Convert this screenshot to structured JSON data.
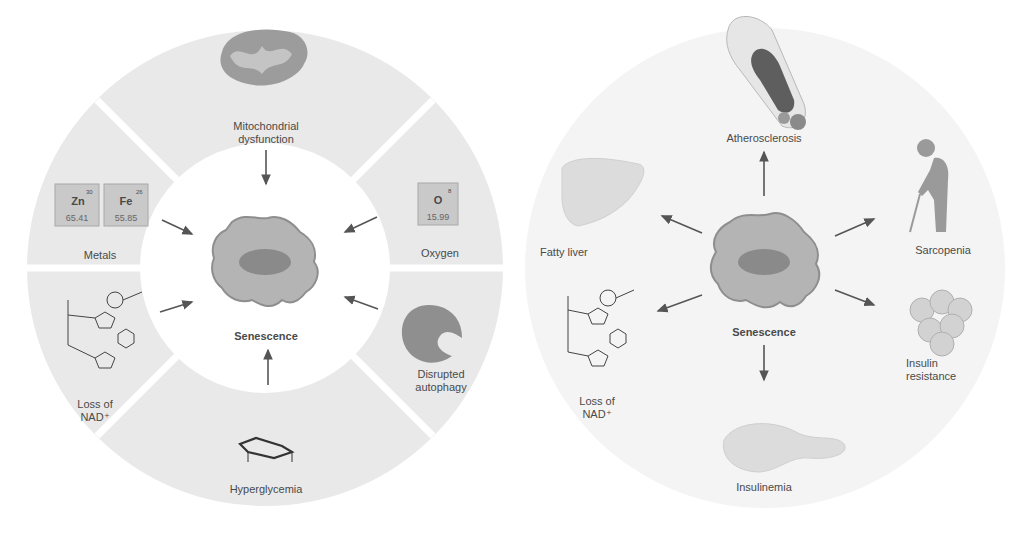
{
  "left_panel": {
    "center_label": "Senescence",
    "segments": [
      {
        "id": "mito",
        "label_line1": "Mitochondrial",
        "label_line2": "dysfunction",
        "icon": "mitochondrion-icon"
      },
      {
        "id": "oxygen",
        "label_line1": "Oxygen",
        "label_line2": "",
        "icon": "oxygen-element-tile"
      },
      {
        "id": "autophagy",
        "label_line1": "Disrupted",
        "label_line2": "autophagy",
        "icon": "autophagosome-icon"
      },
      {
        "id": "hyperglycemia",
        "label_line1": "Hyperglycemia",
        "label_line2": "",
        "icon": "glucose-molecule-icon"
      },
      {
        "id": "nad",
        "label_line1": "Loss of",
        "label_line2": "NAD⁺",
        "icon": "nad-molecule-icon"
      },
      {
        "id": "metals",
        "label_line1": "Metals",
        "label_line2": "",
        "icon": "metal-element-tiles"
      }
    ],
    "elements": [
      {
        "symbol": "Zn",
        "number": "30",
        "mass": "65.41"
      },
      {
        "symbol": "Fe",
        "number": "26",
        "mass": "55.85"
      },
      {
        "symbol": "O",
        "number": "8",
        "mass": "15.99"
      }
    ]
  },
  "right_panel": {
    "center_label": "Senescence",
    "outcomes": [
      {
        "id": "athero",
        "label_line1": "Atherosclerosis",
        "label_line2": "",
        "icon": "artery-plaque-icon"
      },
      {
        "id": "sarcopenia",
        "label_line1": "Sarcopenia",
        "label_line2": "",
        "icon": "elderly-person-cane-icon"
      },
      {
        "id": "insulin_res",
        "label_line1": "Insulin",
        "label_line2": "resistance",
        "icon": "adipocyte-cluster-icon"
      },
      {
        "id": "insulinemia",
        "label_line1": "Insulinemia",
        "label_line2": "",
        "icon": "pancreas-icon"
      },
      {
        "id": "nad",
        "label_line1": "Loss of",
        "label_line2": "NAD⁺",
        "icon": "nad-molecule-icon"
      },
      {
        "id": "fatty_liver",
        "label_line1": "Fatty liver",
        "label_line2": "",
        "icon": "liver-icon"
      }
    ]
  },
  "colors": {
    "ring": "#e9e9e9",
    "ring_right": "#f3f3f3",
    "cell": "#b4b4b4",
    "cell_edge": "#8e8e8e",
    "nucleus": "#8a8a8a",
    "arrow": "#555555",
    "tile": "#c9c9c9"
  }
}
